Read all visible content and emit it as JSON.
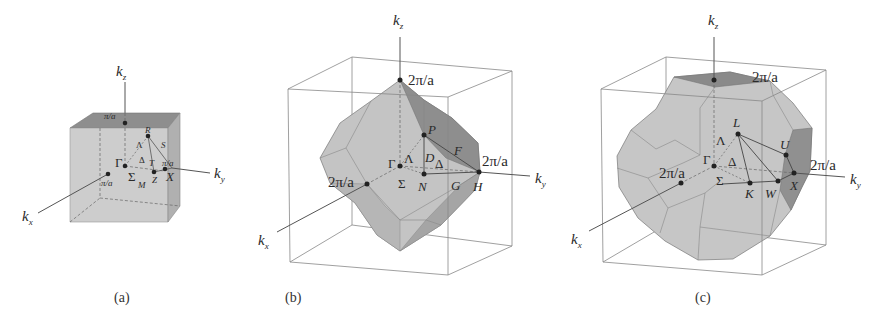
{
  "figure": {
    "panels": [
      {
        "id": "a",
        "caption": "(a)",
        "lattice": "simple cubic",
        "axis_labels": {
          "kz": "k",
          "kz_sub": "z",
          "ky": "k",
          "ky_sub": "y",
          "kx": "k",
          "kx_sub": "x"
        },
        "boundary_labels": {
          "top": "π/a",
          "y": "π/a",
          "x": "π/a"
        },
        "points": {
          "Gamma": "Γ",
          "R": "R",
          "X": "X",
          "M": "M"
        },
        "lines": {
          "Lambda": "Λ",
          "Delta": "Δ",
          "Sigma": "Σ",
          "S": "S",
          "T": "T",
          "Z": "Z"
        }
      },
      {
        "id": "b",
        "caption": "(b)",
        "lattice": "bcc",
        "axis_labels": {
          "kz": "k",
          "kz_sub": "z",
          "ky": "k",
          "ky_sub": "y",
          "kx": "k",
          "kx_sub": "x"
        },
        "boundary_labels": {
          "top": "2π/a",
          "y": "2π/a",
          "x": "2π/a"
        },
        "points": {
          "Gamma": "Γ",
          "P": "P",
          "N": "N",
          "H": "H"
        },
        "lines": {
          "Lambda": "Λ",
          "Delta": "Δ",
          "Sigma": "Σ",
          "D": "D",
          "F": "F",
          "G": "G"
        }
      },
      {
        "id": "c",
        "caption": "(c)",
        "lattice": "fcc",
        "axis_labels": {
          "kz": "k",
          "kz_sub": "z",
          "ky": "k",
          "ky_sub": "y",
          "kx": "k",
          "kx_sub": "x"
        },
        "boundary_labels": {
          "top": "2π/a",
          "y": "2π/a",
          "x": "2π/a"
        },
        "points": {
          "Gamma": "Γ",
          "L": "L",
          "U": "U",
          "X": "X",
          "K": "K",
          "W": "W"
        },
        "lines": {
          "Lambda": "Λ",
          "Delta": "Δ",
          "Sigma": "Σ"
        }
      }
    ],
    "colors": {
      "face_light": "#c8c8c8",
      "face_mid": "#b4b4b4",
      "face_dark": "#8c8c8c",
      "edge": "#6a6a6a",
      "frame": "#7a7a7a",
      "text": "#2a2a2a"
    }
  }
}
